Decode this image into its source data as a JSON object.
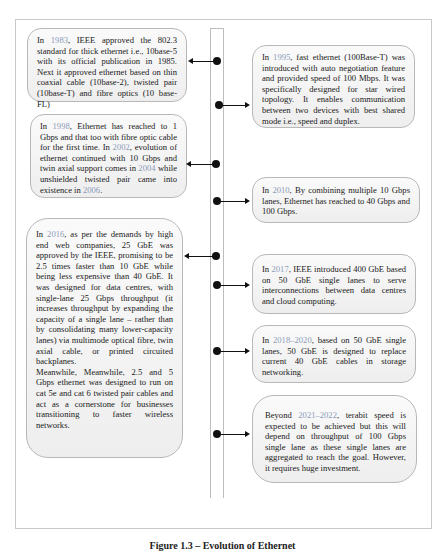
{
  "figure": {
    "caption": "Figure 1.3 – Evolution of Ethernet",
    "year_color": "#8c9bb8",
    "box_border_color": "#b8b8b8",
    "box_fill_top": "#fafafa",
    "box_fill_bottom": "#eeeeee"
  },
  "left_entries": [
    {
      "year": "1983",
      "parts": [
        "In ",
        "1983",
        ", IEEE approved the 802.3 standard for thick ethernet i.e., 10base-5 with its official publication in 1985. Next it approved ethernet based on thin coaxial cable (10base-2), twisted pair (10base-T) and fibre optics (10 base-FL)"
      ]
    },
    {
      "year": "1998",
      "parts": [
        "In ",
        "1998",
        ", Ethernet has reached to 1 Gbps and that too with fibre optic cable for the first time. In ",
        "2002",
        ", evolution of ethernet continued with 10 Gbps and twin axial support comes in ",
        "2004",
        " while unshielded twisted pair came into existence in ",
        "2006",
        "."
      ]
    },
    {
      "year": "2016",
      "parts": [
        "In ",
        "2016",
        ", as per the demands by high end web companies, 25 GbE was approved by the IEEE, promising to be 2.5 times faster than 10 GbE while being less expensive than 40 GbE. It was designed for data centres, with single-lane 25 Gbps throughput (it increases throughput by expanding the capacity of a single lane – rather than by consolidating many lower-capacity lanes) via multimode optical fibre, twin axial cable, or printed circuited backplanes."
      ],
      "extra": "Meanwhile, Meanwhile, 2.5 and 5 Gbps ethernet was designed to run on cat 5e and cat 6 twisted pair cables and act as a cornerstone for businesses transitioning to faster wireless networks."
    }
  ],
  "right_entries": [
    {
      "year": "1995",
      "parts": [
        "In ",
        "1995",
        ", fast ethernet (100Base-T) was introduced with auto negotiation feature and provided speed of 100 Mbps. It was specifically designed for star wired topology. It enables communication between two devices with best shared mode i.e., speed and duplex."
      ]
    },
    {
      "year": "2010",
      "parts": [
        "In ",
        "2010",
        ", By combining multiple 10 Gbps lanes, Ethernet has reached to 40 Gbps and 100 Gbps."
      ]
    },
    {
      "year": "2017",
      "parts": [
        "In ",
        "2017",
        ", IEEE introduced 400 GbE based on 50 GbE single lanes to serve interconnections between data centres and cloud computing."
      ]
    },
    {
      "year": "2018–2020",
      "parts": [
        "In ",
        "2018–2020",
        ", based on 50 GbE single lanes, 50 GbE is designed to replace current 40 GbE cables in storage networking."
      ]
    },
    {
      "year": "2021–2022",
      "parts": [
        "Beyond ",
        "2021–2022",
        ", terabit speed is expected to be achieved but this will depend on throughput of 100 Gbps single lane as these single lanes are aggregated to reach the goal. However, it requires huge investment."
      ]
    }
  ]
}
